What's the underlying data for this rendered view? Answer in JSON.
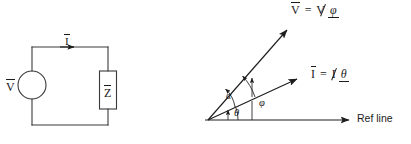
{
  "figure": {
    "background_color": "#ffffff",
    "line_color": "#3a3a3a",
    "text_color": "#1b1b1b"
  },
  "circuit": {
    "source": {
      "label": "V",
      "overbar": true,
      "shape": "circle",
      "name": "voltage-source"
    },
    "impedance": {
      "label": "Z",
      "overbar": true,
      "shape": "rectangle",
      "name": "impedance-box"
    },
    "current": {
      "label": "I",
      "overbar": true,
      "name": "current-arrow",
      "direction": "right"
    }
  },
  "phasor": {
    "voltage": {
      "symbol": "V",
      "equals": "=",
      "magnitude": "V",
      "angle_symbol": "φ",
      "full_label": "V = V∠φ"
    },
    "current": {
      "symbol": "I",
      "equals": "=",
      "magnitude": "I",
      "angle_symbol": "θ",
      "full_label": "I = I∠θ"
    },
    "angles": {
      "alpha": "α",
      "phi": "φ",
      "theta": "θ"
    },
    "reference_line": {
      "label": "Ref line"
    }
  }
}
